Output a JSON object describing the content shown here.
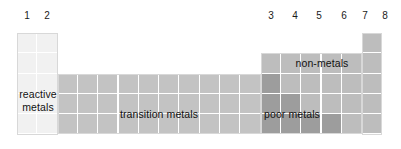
{
  "diagram": {
    "column_numbers_left": [
      "1",
      "2"
    ],
    "column_numbers_right": [
      "3",
      "4",
      "5",
      "6",
      "7",
      "8"
    ],
    "groups": [
      {
        "key": "reactive",
        "label": "reactive metals",
        "label_lines": [
          "reactive",
          "metals"
        ],
        "color": "#f1f1f1"
      },
      {
        "key": "transition",
        "label": "transition metals",
        "label_lines": [
          "transition metals"
        ],
        "color": "#c3c3c3"
      },
      {
        "key": "poor",
        "label": "poor metals",
        "label_lines": [
          "poor metals"
        ],
        "color": "#9d9d9d"
      },
      {
        "key": "nonmetals",
        "label": "non-metals",
        "label_lines": [
          "non-metals"
        ],
        "color": "#bdbdbd"
      }
    ],
    "grid": {
      "columns": 18,
      "rows": 5,
      "gridline_color": "#ffffff",
      "outline_color": "#d8d8d8"
    },
    "background": "#ffffff"
  }
}
